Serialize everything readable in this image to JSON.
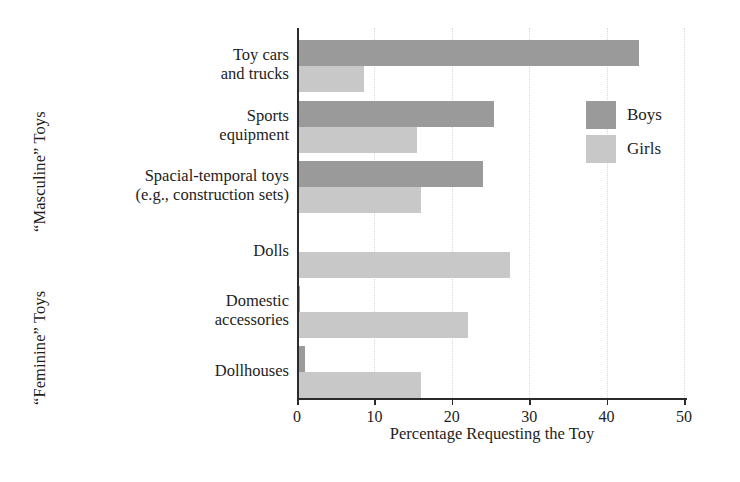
{
  "chart_data": {
    "type": "bar",
    "orientation": "horizontal",
    "title": "",
    "xlabel": "Percentage Requesting the Toy",
    "ylabel": "",
    "xlim": [
      0,
      50
    ],
    "xticks": [
      0,
      10,
      20,
      30,
      40,
      50
    ],
    "grid": "dotted vertical gridlines",
    "legend_position": "upper right inside plot",
    "categories": [
      "Toy cars and trucks",
      "Sports equipment",
      "Spacial-temporal toys (e.g., construction sets)",
      "Dolls",
      "Domestic accessories",
      "Dollhouses"
    ],
    "series": [
      {
        "name": "Boys",
        "color": "#9a9a9a",
        "values": [
          44.2,
          25.4,
          24.0,
          0.3,
          0.4,
          1.0
        ]
      },
      {
        "name": "Girls",
        "color": "#c8c8c8",
        "values": [
          8.6,
          15.5,
          16.0,
          27.5,
          22.1,
          16.0
        ]
      }
    ],
    "group_labels": {
      "masculine": "“Masculine” Toys",
      "feminine": "“Feminine” Toys"
    }
  },
  "axis": {
    "x_title": "Percentage Requesting the Toy",
    "tick_labels": [
      "0",
      "10",
      "20",
      "30",
      "40",
      "50"
    ]
  },
  "category_labels": [
    {
      "line1": "Toy cars",
      "line2": "and trucks"
    },
    {
      "line1": "Sports",
      "line2": "equipment"
    },
    {
      "line1": "Spacial-temporal toys",
      "line2": "(e.g., construction sets)"
    },
    {
      "line1": "Dolls",
      "line2": ""
    },
    {
      "line1": "Domestic",
      "line2": "accessories"
    },
    {
      "line1": "Dollhouses",
      "line2": ""
    }
  ],
  "legend": {
    "items": [
      {
        "label": "Boys",
        "color": "#9a9a9a"
      },
      {
        "label": "Girls",
        "color": "#c8c8c8"
      }
    ]
  },
  "group_labels": {
    "masculine": "“Masculine” Toys",
    "feminine": "“Feminine” Toys"
  }
}
